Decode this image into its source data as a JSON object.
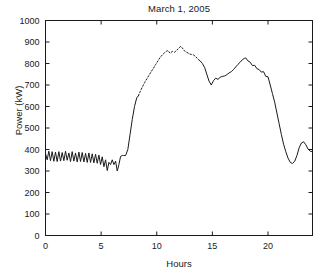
{
  "chart_data": {
    "type": "line",
    "title": "March 1, 2005",
    "xlabel": "Hours",
    "ylabel": "Power (kW)",
    "xlim": [
      0,
      24
    ],
    "ylim": [
      0,
      1000
    ],
    "xticks": [
      0,
      5,
      10,
      15,
      20
    ],
    "yticks": [
      0,
      100,
      200,
      300,
      400,
      500,
      600,
      700,
      800,
      900,
      1000
    ],
    "xticklabels": [
      "0",
      "5",
      "10",
      "15",
      "20"
    ],
    "yticklabels": [
      "0",
      "100",
      "200",
      "300",
      "400",
      "500",
      "600",
      "700",
      "800",
      "900",
      "1000"
    ],
    "grid": false,
    "legend": false,
    "line_color": "#1a1a1a",
    "line_width": 1.0,
    "series": [
      {
        "name": "Measured power",
        "style": "solid",
        "x": [
          0.0,
          0.15,
          0.3,
          0.45,
          0.6,
          0.75,
          0.9,
          1.05,
          1.2,
          1.35,
          1.5,
          1.65,
          1.8,
          1.95,
          2.1,
          2.25,
          2.4,
          2.55,
          2.7,
          2.85,
          3.0,
          3.15,
          3.3,
          3.45,
          3.6,
          3.75,
          3.9,
          4.05,
          4.2,
          4.35,
          4.5,
          4.65,
          4.8,
          4.95,
          5.1,
          5.25,
          5.4,
          5.55,
          5.7,
          5.85,
          6.0,
          6.15,
          6.3,
          6.45,
          6.6,
          6.75,
          6.9,
          7.0,
          7.2,
          7.4,
          7.6,
          7.8,
          8.0,
          8.2,
          8.35
        ],
        "y": [
          382,
          352,
          392,
          348,
          390,
          345,
          388,
          344,
          390,
          346,
          386,
          348,
          392,
          350,
          384,
          344,
          390,
          346,
          384,
          342,
          388,
          344,
          386,
          342,
          382,
          340,
          384,
          340,
          380,
          338,
          378,
          336,
          374,
          330,
          366,
          320,
          352,
          302,
          340,
          330,
          352,
          330,
          346,
          300,
          330,
          368,
          372,
          372,
          372,
          400,
          470,
          540,
          600,
          640,
          650
        ]
      },
      {
        "name": "Interpolated power",
        "style": "dotted",
        "x": [
          8.35,
          8.5,
          8.7,
          8.9,
          9.1,
          9.3,
          9.5,
          9.7,
          9.9,
          10.1,
          10.3,
          10.5,
          10.7,
          10.9,
          11.0,
          11.2,
          11.4,
          11.6,
          11.8,
          12.0,
          12.15,
          12.3,
          12.5,
          12.7,
          12.9,
          13.1,
          13.3,
          13.5,
          13.7,
          13.9
        ],
        "y": [
          650,
          668,
          690,
          710,
          728,
          745,
          762,
          778,
          795,
          812,
          828,
          840,
          850,
          858,
          860,
          848,
          856,
          852,
          862,
          872,
          880,
          872,
          858,
          852,
          846,
          842,
          840,
          832,
          820,
          812
        ]
      },
      {
        "name": "Measured power (afternoon)",
        "style": "solid",
        "x": [
          13.9,
          14.1,
          14.3,
          14.5,
          14.7,
          14.9,
          15.1,
          15.3,
          15.5,
          15.7,
          15.9,
          16.1,
          16.3,
          16.5,
          16.7,
          16.9,
          17.1,
          17.3,
          17.5,
          17.7,
          17.9,
          18.0,
          18.2,
          18.4,
          18.6,
          18.8,
          19.0,
          19.2,
          19.4,
          19.6,
          19.8,
          20.0,
          20.2,
          20.4,
          20.6,
          20.8,
          21.0,
          21.2,
          21.4,
          21.6,
          21.8,
          22.0,
          22.2,
          22.4,
          22.6,
          22.8,
          23.0,
          23.2,
          23.4,
          23.6,
          23.8,
          24.0
        ],
        "y": [
          812,
          800,
          782,
          750,
          718,
          700,
          720,
          732,
          726,
          736,
          740,
          742,
          748,
          756,
          762,
          772,
          784,
          796,
          806,
          818,
          824,
          826,
          812,
          806,
          790,
          792,
          776,
          772,
          760,
          762,
          740,
          738,
          700,
          660,
          620,
          570,
          520,
          470,
          425,
          390,
          360,
          340,
          335,
          345,
          372,
          408,
          430,
          436,
          422,
          402,
          392,
          390
        ]
      }
    ]
  }
}
